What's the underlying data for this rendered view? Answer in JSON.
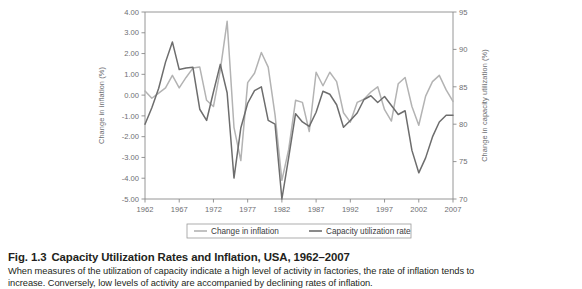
{
  "figure": {
    "number": "Fig. 1.3",
    "title": "Capacity Utilization Rates and Inflation, USA, 1962–2007",
    "body_line1": "When measures of the utilization of capacity indicate a high level of activity in factories, the rate of inflation tends to",
    "body_line2": "increase. Conversely, low levels of activity are accompanied by declining rates of inflation."
  },
  "colors": {
    "inflation_line": "#b3b3b3",
    "capacity_line": "#6d6d6d",
    "axis": "#8a8a8a",
    "tick_text": "#6d6e71",
    "legend_border": "#9a9a9a",
    "caption_text": "#231f20"
  },
  "legend": {
    "position": "below-axis",
    "items": [
      {
        "label": "Change in inflation",
        "color": "#b3b3b3"
      },
      {
        "label": "Capacity utilization rate",
        "color": "#6d6d6d"
      }
    ]
  },
  "chart_data": {
    "type": "line",
    "title": "Capacity Utilization Rates and Inflation, USA, 1962–2007",
    "xlabel": "",
    "ylabel": "Change in inflation (%)",
    "y2label": "Change in capacity utilization (%)",
    "grid": false,
    "xlim": [
      1962,
      2007
    ],
    "ylim": [
      -5.0,
      4.0
    ],
    "y2lim": [
      70,
      95
    ],
    "xticks": [
      1962,
      1967,
      1972,
      1977,
      1982,
      1987,
      1992,
      1997,
      2002,
      2007
    ],
    "xticklabels": [
      "1962",
      "1967",
      "1972",
      "1977",
      "1982",
      "1987",
      "1992",
      "1997",
      "2002",
      "2007"
    ],
    "yticks": [
      4.0,
      3.0,
      2.0,
      1.0,
      0.0,
      -1.0,
      -2.0,
      -3.0,
      -4.0,
      -5.0
    ],
    "yticklabels": [
      "4.00",
      "3.00",
      "2.00",
      "1.00",
      "0.00",
      "-1.00",
      "-2.00",
      "-3.00",
      "-4.00",
      "-5.00"
    ],
    "y2ticks": [
      95,
      90,
      85,
      80,
      75,
      70
    ],
    "y2ticklabels": [
      "95",
      "90",
      "85",
      "80",
      "75",
      "70"
    ],
    "x": [
      1962,
      1963,
      1964,
      1965,
      1966,
      1967,
      1968,
      1969,
      1970,
      1971,
      1972,
      1973,
      1974,
      1975,
      1976,
      1977,
      1978,
      1979,
      1980,
      1981,
      1982,
      1983,
      1984,
      1985,
      1986,
      1987,
      1988,
      1989,
      1990,
      1991,
      1992,
      1993,
      1994,
      1995,
      1996,
      1997,
      1998,
      1999,
      2000,
      2001,
      2002,
      2003,
      2004,
      2005,
      2006,
      2007
    ],
    "series": [
      {
        "name": "Change in inflation",
        "axis": "left",
        "color": "#b3b3b3",
        "values": [
          0.2,
          -0.15,
          0.1,
          0.35,
          0.95,
          0.35,
          0.85,
          1.3,
          1.35,
          -0.25,
          -0.55,
          1.2,
          3.55,
          -1.55,
          -3.15,
          0.6,
          1.05,
          2.05,
          1.35,
          -0.95,
          -4.1,
          -2.6,
          -0.25,
          -0.35,
          -1.75,
          1.1,
          0.45,
          1.1,
          0.65,
          -0.85,
          -1.3,
          -0.35,
          -0.2,
          0.15,
          0.4,
          -0.7,
          -1.25,
          0.55,
          0.85,
          -0.55,
          -1.45,
          -0.05,
          0.65,
          0.95,
          0.25,
          -0.3
        ]
      },
      {
        "name": "Capacity utilization rate",
        "axis": "right",
        "color": "#6d6d6d",
        "values": [
          80.0,
          82.2,
          84.8,
          88.3,
          91.0,
          87.3,
          87.5,
          87.6,
          82.0,
          80.5,
          84.3,
          88.0,
          84.2,
          72.8,
          79.5,
          82.8,
          84.5,
          85.0,
          80.5,
          80.0,
          70.0,
          75.6,
          81.4,
          80.3,
          79.7,
          81.6,
          84.4,
          84.0,
          82.6,
          79.6,
          80.5,
          81.5,
          83.3,
          83.8,
          82.9,
          83.7,
          82.5,
          81.3,
          81.8,
          76.5,
          73.5,
          75.5,
          78.3,
          80.3,
          81.2,
          81.2
        ]
      }
    ]
  }
}
